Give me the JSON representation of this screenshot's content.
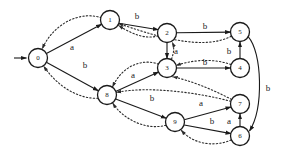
{
  "diagram": {
    "background_color": "#ffffff",
    "stroke_color": "#1a1a1a",
    "node_radius": 9.5,
    "start_marker": {
      "name": "start-arrow",
      "from_x": 14,
      "from_y": 58,
      "to_x": 27,
      "to_y": 58
    },
    "nodes": [
      {
        "id": "0",
        "label": "0",
        "cx": 38,
        "cy": 58
      },
      {
        "id": "1",
        "label": "1",
        "cx": 110,
        "cy": 20
      },
      {
        "id": "2",
        "label": "2",
        "cx": 167,
        "cy": 33
      },
      {
        "id": "3",
        "label": "3",
        "cx": 167,
        "cy": 68
      },
      {
        "id": "4",
        "label": "4",
        "cx": 240,
        "cy": 68
      },
      {
        "id": "5",
        "label": "5",
        "cx": 240,
        "cy": 32
      },
      {
        "id": "6",
        "label": "6",
        "cx": 240,
        "cy": 136
      },
      {
        "id": "7",
        "label": "7",
        "cx": 240,
        "cy": 104
      },
      {
        "id": "8",
        "label": "8",
        "cx": 107,
        "cy": 95
      },
      {
        "id": "9",
        "label": "9",
        "cx": 175,
        "cy": 122
      }
    ],
    "edges": [
      {
        "name": "edge-0-1",
        "from": "0",
        "to": "1",
        "label": "a",
        "style": "solid",
        "label_x": 72,
        "label_y": 47
      },
      {
        "name": "edge-0-8",
        "from": "0",
        "to": "8",
        "label": "b",
        "style": "solid",
        "label_x": 85,
        "label_y": 65
      },
      {
        "name": "edge-1-2",
        "from": "1",
        "to": "2",
        "label": "b",
        "style": "solid",
        "label_x": 137,
        "label_y": 16
      },
      {
        "name": "edge-2-5",
        "from": "2",
        "to": "5",
        "label": "b",
        "style": "solid",
        "label_x": 205,
        "label_y": 26
      },
      {
        "name": "edge-2-3",
        "from": "2",
        "to": "3",
        "label": "a",
        "style": "solid",
        "label_x": 176,
        "label_y": 51
      },
      {
        "name": "edge-3-4",
        "from": "3",
        "to": "4",
        "label": "b",
        "style": "solid",
        "label_x": 205,
        "label_y": 62
      },
      {
        "name": "edge-4-5",
        "from": "4",
        "to": "5",
        "label": "b",
        "style": "solid",
        "label_x": 229,
        "label_y": 51
      },
      {
        "name": "edge-8-3",
        "from": "8",
        "to": "3",
        "label": "a",
        "style": "solid",
        "label_x": 133,
        "label_y": 75
      },
      {
        "name": "edge-8-9",
        "from": "8",
        "to": "9",
        "label": "b",
        "style": "solid",
        "label_x": 152,
        "label_y": 98
      },
      {
        "name": "edge-9-7",
        "from": "9",
        "to": "7",
        "label": "a",
        "style": "solid",
        "label_x": 201,
        "label_y": 103
      },
      {
        "name": "edge-9-6",
        "from": "9",
        "to": "6",
        "label": "b",
        "style": "solid",
        "label_x": 212,
        "label_y": 121
      },
      {
        "name": "edge-6-7",
        "from": "6",
        "to": "7",
        "label": "a",
        "style": "solid",
        "label_x": 229,
        "label_y": 121
      },
      {
        "name": "edge-5-6",
        "from": "5",
        "to": "6",
        "label": "b",
        "style": "solid",
        "label_x": 268,
        "label_y": 88
      },
      {
        "name": "edge-1-0",
        "from": "1",
        "to": "0",
        "label": "",
        "style": "dotted"
      },
      {
        "name": "edge-2-1",
        "from": "2",
        "to": "1",
        "label": "",
        "style": "dotted"
      },
      {
        "name": "edge-3-8",
        "from": "3",
        "to": "8",
        "label": "",
        "style": "dotted"
      },
      {
        "name": "edge-3-2",
        "from": "3",
        "to": "2",
        "label": "",
        "style": "dotted"
      },
      {
        "name": "edge-4-3",
        "from": "4",
        "to": "3",
        "label": "",
        "style": "dotted"
      },
      {
        "name": "edge-5-1",
        "from": "5",
        "to": "1",
        "label": "",
        "style": "dotted"
      },
      {
        "name": "edge-8-0",
        "from": "8",
        "to": "0",
        "label": "",
        "style": "dotted"
      },
      {
        "name": "edge-9-8",
        "from": "9",
        "to": "8",
        "label": "",
        "style": "dotted"
      },
      {
        "name": "edge-7-3",
        "from": "7",
        "to": "3",
        "label": "",
        "style": "dotted"
      },
      {
        "name": "edge-6-9",
        "from": "6",
        "to": "9",
        "label": "",
        "style": "dotted"
      },
      {
        "name": "edge-7-8",
        "from": "7",
        "to": "8",
        "label": "",
        "style": "dotted"
      }
    ]
  }
}
